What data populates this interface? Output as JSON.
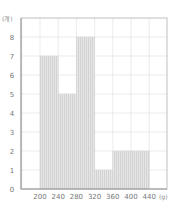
{
  "chart_data": {
    "type": "bar",
    "subtype": "histogram",
    "title": "",
    "xlabel": "(g)",
    "ylabel": "(개)",
    "bin_edges": [
      200,
      240,
      280,
      320,
      360,
      400,
      440
    ],
    "categories": [
      "200-240",
      "240-280",
      "280-320",
      "320-360",
      "360-400",
      "400-440"
    ],
    "values": [
      7,
      5,
      8,
      1,
      2,
      2
    ],
    "x_ticks": [
      "200",
      "240",
      "280",
      "320",
      "360",
      "400",
      "440"
    ],
    "y_ticks": [
      "0",
      "1",
      "2",
      "3",
      "4",
      "5",
      "6",
      "7",
      "8"
    ],
    "ylim": [
      0,
      9
    ],
    "xlim": [
      160,
      480
    ],
    "grid": true,
    "legend": null,
    "colors": {
      "bar_fill": "#e3e3e3",
      "bar_stripe": "#cfcfcf",
      "grid": "#dedede",
      "axis": "#b0b0b0"
    }
  },
  "labels": {
    "y_unit": "(개)",
    "x_unit": "(g)"
  }
}
